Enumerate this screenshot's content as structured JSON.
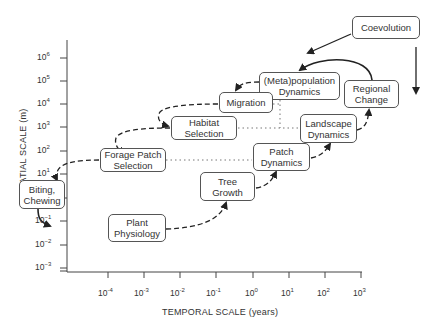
{
  "diagram": {
    "type": "scale-hierarchy",
    "x_axis": {
      "label": "TEMPORAL SCALE (years)",
      "ticks": [
        {
          "base": "10",
          "exp": "-4"
        },
        {
          "base": "10",
          "exp": "-3"
        },
        {
          "base": "10",
          "exp": "-2"
        },
        {
          "base": "10",
          "exp": "-1"
        },
        {
          "base": "10",
          "exp": "0"
        },
        {
          "base": "10",
          "exp": "1"
        },
        {
          "base": "10",
          "exp": "2"
        },
        {
          "base": "10",
          "exp": "3"
        }
      ]
    },
    "y_axis": {
      "label": "SPATIAL SCALE (m)",
      "ticks": [
        {
          "base": "10",
          "exp": "6"
        },
        {
          "base": "10",
          "exp": "5"
        },
        {
          "base": "10",
          "exp": "4"
        },
        {
          "base": "10",
          "exp": "3"
        },
        {
          "base": "10",
          "exp": "2"
        },
        {
          "base": "10",
          "exp": "1"
        },
        {
          "base": "10",
          "exp": "0"
        },
        {
          "base": "10",
          "exp": "−1"
        },
        {
          "base": "10",
          "exp": "−2"
        },
        {
          "base": "10",
          "exp": "−3"
        }
      ]
    },
    "nodes": {
      "coevolution": {
        "line1": "Coevolution",
        "line2": ""
      },
      "metapopulation": {
        "line1": "(Meta)population",
        "line2": "Dynamics"
      },
      "regional_change": {
        "line1": "Regional",
        "line2": "Change"
      },
      "migration": {
        "line1": "Migration",
        "line2": ""
      },
      "habitat_selection": {
        "line1": "Habitat",
        "line2": "Selection"
      },
      "landscape_dynamics": {
        "line1": "Landscape",
        "line2": "Dynamics"
      },
      "forage_patch": {
        "line1": "Forage Patch",
        "line2": "Selection"
      },
      "patch_dynamics": {
        "line1": "Patch",
        "line2": "Dynamics"
      },
      "tree_growth": {
        "line1": "Tree",
        "line2": "Growth"
      },
      "biting_chewing": {
        "line1": "Biting,",
        "line2": "Chewing"
      },
      "plant_physiology": {
        "line1": "Plant",
        "line2": "Physiology"
      }
    },
    "edges": [
      {
        "from": "Coevolution",
        "to": "(Meta)population Dynamics",
        "style": "solid"
      },
      {
        "from": "Coevolution",
        "to": "below",
        "style": "solid"
      },
      {
        "from": "Regional Change",
        "to": "(Meta)population Dynamics",
        "style": "solid"
      },
      {
        "from": "(Meta)population Dynamics",
        "to": "Migration",
        "style": "dashed"
      },
      {
        "from": "Migration",
        "to": "Habitat Selection",
        "style": "dashed"
      },
      {
        "from": "Habitat Selection",
        "to": "Forage Patch Selection",
        "style": "dashed"
      },
      {
        "from": "Forage Patch Selection",
        "to": "Biting, Chewing",
        "style": "dashed"
      },
      {
        "from": "Biting, Chewing",
        "to": "Plant Physiology",
        "style": "solid"
      },
      {
        "from": "Plant Physiology",
        "to": "Tree Growth",
        "style": "dashed"
      },
      {
        "from": "Tree Growth",
        "to": "Patch Dynamics",
        "style": "dashed"
      },
      {
        "from": "Patch Dynamics",
        "to": "Landscape Dynamics",
        "style": "dashed"
      },
      {
        "from": "Landscape Dynamics",
        "to": "Regional Change",
        "style": "dashed"
      },
      {
        "from": "Forage Patch Selection",
        "to": "Patch Dynamics",
        "style": "dotted"
      },
      {
        "from": "Habitat Selection",
        "to": "Landscape Dynamics",
        "style": "dotted"
      },
      {
        "from": "Migration",
        "to": "Landscape Dynamics",
        "style": "dotted"
      }
    ]
  }
}
